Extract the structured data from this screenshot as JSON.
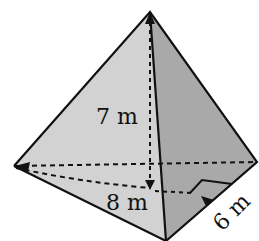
{
  "figure": {
    "type": "triangular-pyramid",
    "labels": {
      "height": "7 m",
      "base_segment": "8 m",
      "slant_segment": "6 m"
    },
    "colors": {
      "left_face": "#d2d2d2",
      "right_face": "#a9a9a9",
      "edge": "#111111"
    }
  }
}
